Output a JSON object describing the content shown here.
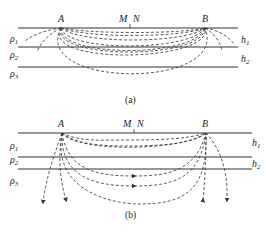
{
  "figure": {
    "panels": [
      {
        "id": "a",
        "caption": "(a)",
        "electrodes": {
          "A": "A",
          "B": "B",
          "M": "M",
          "N": "N"
        },
        "layers": [
          {
            "resistivity": "ρ",
            "sub": "1",
            "thickness": "h",
            "thickness_sub": "1"
          },
          {
            "resistivity": "ρ",
            "sub": "2",
            "thickness": "h",
            "thickness_sub": "2"
          },
          {
            "resistivity": "ρ",
            "sub": "3"
          }
        ],
        "description": "Current flow lines between electrodes A and B through a three-layer medium"
      },
      {
        "id": "b",
        "caption": "(b)",
        "electrodes": {
          "A": "A",
          "B": "B",
          "M": "M",
          "N": "N"
        },
        "layers": [
          {
            "resistivity": "ρ",
            "sub": "1",
            "thickness": "h",
            "thickness_sub": "1"
          },
          {
            "resistivity": "ρ",
            "sub": "2",
            "thickness": "h",
            "thickness_sub": "2"
          },
          {
            "resistivity": "ρ",
            "sub": "3"
          }
        ],
        "description": "Current flow lines with arrows; some lines diverge downward into layer ρ3"
      }
    ]
  }
}
